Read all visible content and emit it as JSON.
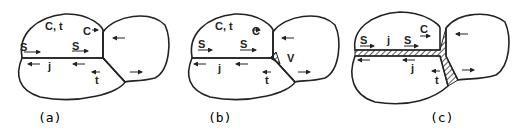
{
  "figure": {
    "panels": [
      {
        "id": "a",
        "caption": "(a)",
        "labels": [
          "C, t",
          "C",
          "S",
          "S",
          "j",
          "t"
        ]
      },
      {
        "id": "b",
        "caption": "(b)",
        "labels": [
          "C, t",
          "C",
          "S",
          "S",
          "j",
          "V",
          "t"
        ]
      },
      {
        "id": "c",
        "caption": "(c)",
        "labels": [
          "C",
          "S",
          "j",
          "S",
          "j",
          "t"
        ]
      }
    ],
    "colors": {
      "ink": "#222222",
      "background": "#ffffff"
    }
  }
}
